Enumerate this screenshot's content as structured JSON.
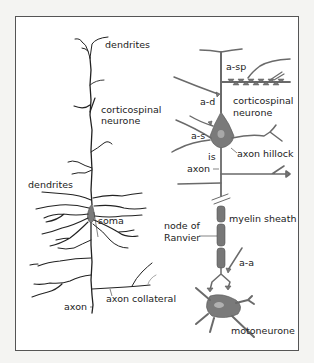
{
  "diagram": {
    "left_panel": {
      "title": "corticospinal neurone (pyramidal cell)",
      "labels": {
        "dendrites_top": "dendrites",
        "corticospinal_line1": "corticospinal",
        "corticospinal_line2": "neurone",
        "dendrites_left": "dendrites",
        "soma": "soma",
        "axon": "axon",
        "axon_collateral": "axon collateral"
      }
    },
    "right_panel": {
      "title": "schematic corticospinal neurone and motoneurone",
      "labels": {
        "a_sp": "a-sp",
        "a_d": "a-d",
        "corticospinal_line1": "corticospinal",
        "corticospinal_line2": "neurone",
        "a_s": "a-s",
        "axon_hillock": "axon hillock",
        "is": "is",
        "axon": "axon",
        "myelin_sheath": "myelin sheath",
        "node_line1": "node of",
        "node_line2": "Ranvier",
        "a_a": "a-a",
        "motoneurone": "motoneurone"
      }
    },
    "colors": {
      "frame": "#555555",
      "line_drawing": "#222222",
      "schematic_fill": "#7a7a7a",
      "background": "#ffffff"
    }
  }
}
